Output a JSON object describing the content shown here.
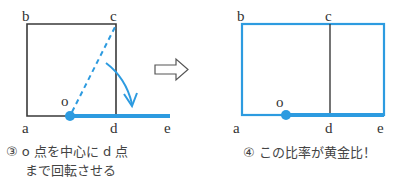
{
  "colors": {
    "blue": "#2d9be0",
    "dark": "#3a3a3a",
    "text": "#444444"
  },
  "left_panel": {
    "labels": {
      "a": "a",
      "b": "b",
      "c": "c",
      "d": "d",
      "e": "e",
      "o": "o"
    },
    "caption_line1": "③ o 点を中心に d 点",
    "caption_line2": "まで回転させる"
  },
  "transition_arrow": "right-outline-arrow",
  "right_panel": {
    "labels": {
      "a": "a",
      "b": "b",
      "c": "c",
      "d": "d",
      "e": "e",
      "o": "o"
    },
    "caption": "④ この比率が黄金比！"
  }
}
